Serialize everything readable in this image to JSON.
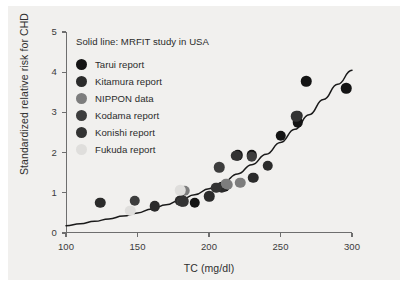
{
  "figure": {
    "panel_bg": "#f1f0ee",
    "page_bg": "#ffffff",
    "axis_color": "#6e6e6e",
    "curve_color": "#1a1a1a"
  },
  "chart_data": {
    "type": "scatter",
    "title": "",
    "xlabel": "TC (mg/dl)",
    "ylabel": "Standardized relative risk for CHD",
    "xlim": [
      100,
      300
    ],
    "ylim": [
      0,
      5
    ],
    "xticks": [
      100,
      150,
      200,
      250,
      300
    ],
    "yticks": [
      0,
      1,
      2,
      3,
      4,
      5
    ],
    "grid": false,
    "legend_position": "top-left",
    "annotation": "Solid line: MRFIT study in USA",
    "series": [
      {
        "name": "Tarui report",
        "color": "#141414",
        "points": [
          [
            181,
            0.82
          ],
          [
            190,
            0.75
          ],
          [
            211,
            1.15
          ],
          [
            220,
            1.93
          ],
          [
            230,
            1.93
          ],
          [
            250,
            2.42
          ],
          [
            262,
            2.75
          ],
          [
            268,
            3.77
          ],
          [
            296,
            3.6
          ]
        ]
      },
      {
        "name": "Kitamura report",
        "color": "#2b2b2b",
        "points": [
          [
            124,
            0.75
          ],
          [
            162,
            0.67
          ],
          [
            180,
            0.8
          ],
          [
            200,
            0.91
          ],
          [
            209,
            1.12
          ],
          [
            231,
            1.37
          ],
          [
            241,
            1.67
          ],
          [
            262,
            2.92
          ]
        ]
      },
      {
        "name": "NIPPON data",
        "color": "#7d7d7d",
        "points": [
          [
            183,
            1.05
          ],
          [
            212,
            1.22
          ],
          [
            222,
            1.25
          ],
          [
            213,
            1.2
          ]
        ]
      },
      {
        "name": "Kodama report",
        "color": "#3d3d3d",
        "points": [
          [
            148,
            0.8
          ],
          [
            181,
            0.78
          ],
          [
            207,
            1.64
          ],
          [
            230,
            1.9
          ]
        ]
      },
      {
        "name": "Konishi report",
        "color": "#333333",
        "points": [
          [
            182,
            0.79
          ],
          [
            205,
            1.12
          ],
          [
            219,
            1.92
          ],
          [
            261,
            2.9
          ]
        ]
      },
      {
        "name": "Fukuda report",
        "color": "#dfdedc",
        "points": [
          [
            145,
            0.55
          ],
          [
            180,
            1.06
          ]
        ]
      }
    ],
    "curve": {
      "label": "MRFIT study in USA",
      "description": "Solid fitted exponential-like curve rising from ~0.18 at TC=100 to ~4.05 at TC=300",
      "points": [
        [
          100,
          0.18
        ],
        [
          110,
          0.23
        ],
        [
          120,
          0.29
        ],
        [
          130,
          0.35
        ],
        [
          140,
          0.42
        ],
        [
          150,
          0.5
        ],
        [
          160,
          0.6
        ],
        [
          170,
          0.7
        ],
        [
          180,
          0.82
        ],
        [
          190,
          0.95
        ],
        [
          200,
          1.1
        ],
        [
          210,
          1.27
        ],
        [
          220,
          1.47
        ],
        [
          230,
          1.7
        ],
        [
          240,
          1.96
        ],
        [
          250,
          2.25
        ],
        [
          260,
          2.58
        ],
        [
          270,
          2.94
        ],
        [
          280,
          3.32
        ],
        [
          290,
          3.7
        ],
        [
          300,
          4.05
        ]
      ]
    }
  },
  "legend": {
    "title": "Solid line: MRFIT study in USA",
    "items": [
      {
        "label": "Tarui report",
        "color": "#141414"
      },
      {
        "label": "Kitamura report",
        "color": "#2b2b2b"
      },
      {
        "label": "NIPPON data",
        "color": "#7d7d7d"
      },
      {
        "label": "Kodama report",
        "color": "#3d3d3d"
      },
      {
        "label": "Konishi report",
        "color": "#333333"
      },
      {
        "label": "Fukuda report",
        "color": "#dfdedc"
      }
    ]
  },
  "axes": {
    "x_tick_labels": [
      "100",
      "150",
      "200",
      "250",
      "300"
    ],
    "y_tick_labels": [
      "0",
      "1",
      "2",
      "3",
      "4",
      "5"
    ],
    "x_title": "TC (mg/dl)",
    "y_title": "Standardized relative risk for CHD"
  }
}
